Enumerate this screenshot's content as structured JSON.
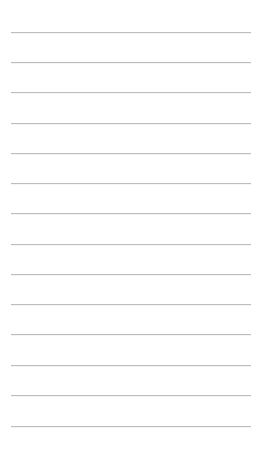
{
  "page": {
    "type": "lined-paper",
    "background_color": "#ffffff",
    "rule_color": "#bdbdbd",
    "rule_count": 14,
    "rules": [
      {
        "y": 32
      },
      {
        "y": 62
      },
      {
        "y": 92
      },
      {
        "y": 123
      },
      {
        "y": 153
      },
      {
        "y": 183
      },
      {
        "y": 213
      },
      {
        "y": 244
      },
      {
        "y": 274
      },
      {
        "y": 304
      },
      {
        "y": 334
      },
      {
        "y": 365
      },
      {
        "y": 395
      },
      {
        "y": 426
      }
    ]
  }
}
